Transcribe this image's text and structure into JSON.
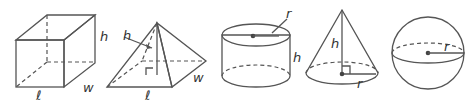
{
  "diagram": {
    "shapes": [
      {
        "name": "rectangular-prism",
        "labels": {
          "height": "h",
          "width": "w",
          "length": "ℓ"
        }
      },
      {
        "name": "square-pyramid",
        "labels": {
          "slant_height": "h",
          "width": "w",
          "length": "ℓ"
        }
      },
      {
        "name": "cylinder",
        "labels": {
          "radius": "r",
          "height": "h"
        }
      },
      {
        "name": "cone",
        "labels": {
          "height": "h",
          "radius": "r"
        }
      },
      {
        "name": "sphere",
        "labels": {
          "radius": "r"
        }
      }
    ],
    "colors": {
      "face_light": "#e6e6e6",
      "face_mid": "#d2d2d2",
      "face_dark": "#c4c4c4",
      "edge": "#555555"
    }
  }
}
